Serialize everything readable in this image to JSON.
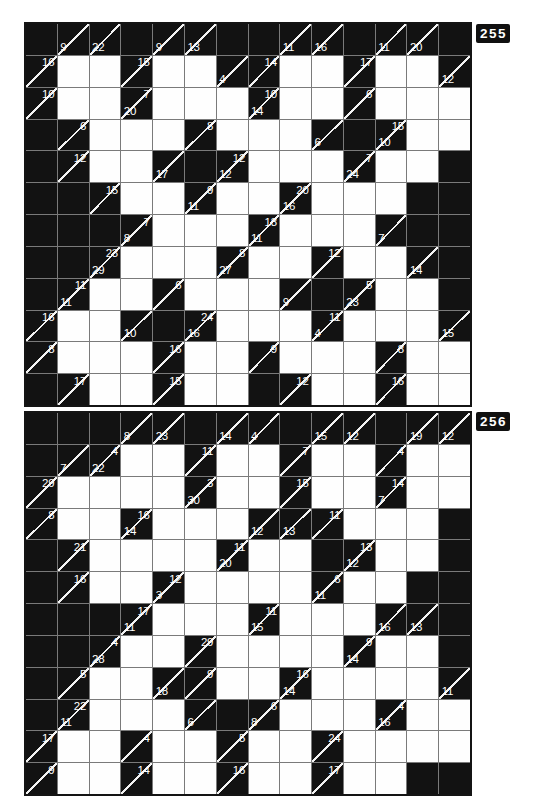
{
  "style": {
    "black_cell_color": "#121212",
    "white_cell_color": "#fefefe",
    "grid_line_color": "#7a7a7a",
    "diagonal_color": "#f2f2f2",
    "clue_text_color": "#ffffff",
    "badge_bg": "#101010",
    "badge_text_color": "#ffffff"
  },
  "cell_legend": {
    ".": "black filled cell",
    "w": "white answer cell",
    "D:A": "clue cell, D = down sum (bottom-left), A = across sum (top-right)"
  },
  "puzzles": [
    {
      "label": "255",
      "rows": 12,
      "cols": 14,
      "grid": [
        [
          ".",
          "9:",
          "22:",
          ".",
          "9:",
          "13:",
          ".",
          ".",
          "11:",
          "16:",
          ".",
          "11:",
          "20:",
          "."
        ],
        [
          ":16",
          "w",
          "w",
          ":15",
          "w",
          "w",
          "4:",
          ":14",
          "w",
          "w",
          ":17",
          "w",
          "w",
          "12:"
        ],
        [
          ":10",
          "w",
          "w",
          "20:7",
          "w",
          "w",
          "w",
          "14:10",
          "w",
          "w",
          ":6",
          "w",
          "w",
          "w"
        ],
        [
          ".",
          ":6",
          "w",
          "w",
          "w",
          ":8",
          "w",
          "w",
          "w",
          "6:",
          ".",
          "10:15",
          "w",
          "w"
        ],
        [
          ".",
          ":12",
          "w",
          "w",
          "17:",
          ".",
          "12:12",
          "w",
          "w",
          "w",
          "24:7",
          "w",
          "w",
          "."
        ],
        [
          ".",
          ".",
          ":15",
          "w",
          "w",
          "11:9",
          "w",
          "w",
          "16:20",
          "w",
          "w",
          "w",
          ".",
          "."
        ],
        [
          ".",
          ".",
          ".",
          "8:7",
          "w",
          "w",
          "w",
          "11:18",
          "w",
          "w",
          "w",
          "7:",
          ".",
          "."
        ],
        [
          ".",
          ".",
          "29:23",
          "w",
          "w",
          "w",
          "27:8",
          "w",
          "w",
          ":12",
          "w",
          "w",
          "14:",
          "."
        ],
        [
          ".",
          "11:11",
          "w",
          "w",
          ":6",
          "w",
          "w",
          "w",
          "9:",
          ".",
          "23:5",
          "w",
          "w",
          "."
        ],
        [
          ":16",
          "w",
          "w",
          "10:",
          ".",
          "16:24",
          "w",
          "w",
          "w",
          "4:11",
          "w",
          "w",
          "w",
          "15:"
        ],
        [
          ":8",
          "w",
          "w",
          "w",
          ":16",
          "w",
          "w",
          ":9",
          "w",
          "w",
          "w",
          ":8",
          "w",
          "w"
        ],
        [
          ".",
          ":17",
          "w",
          "w",
          ":15",
          "w",
          "w",
          ".",
          ":12",
          "w",
          "w",
          ":16",
          "w",
          "w"
        ]
      ]
    },
    {
      "label": "256",
      "rows": 12,
      "cols": 14,
      "grid": [
        [
          ".",
          ".",
          ".",
          "8:",
          "23:",
          ".",
          "14:",
          "4:",
          ".",
          "15:",
          "12:",
          ".",
          "19:",
          "12:"
        ],
        [
          ".",
          "7:",
          "22:4",
          "w",
          "w",
          ":11",
          "w",
          "w",
          ":7",
          "w",
          "w",
          ":4",
          "w",
          "w"
        ],
        [
          ":29",
          "w",
          "w",
          "w",
          "w",
          "30:3",
          "w",
          "w",
          ":15",
          "w",
          "w",
          "7:14",
          "w",
          "w"
        ],
        [
          ":8",
          "w",
          "w",
          "14:16",
          "w",
          "w",
          "w",
          "12:",
          "13:",
          ":11",
          "w",
          "w",
          "w",
          "."
        ],
        [
          ".",
          ":21",
          "w",
          "w",
          "w",
          "w",
          "20:11",
          "w",
          "w",
          ".",
          "12:13",
          "w",
          "w",
          "."
        ],
        [
          ".",
          ":16",
          "w",
          "w",
          "3:12",
          "w",
          "w",
          "w",
          "w",
          "11:6",
          "w",
          "w",
          ".",
          "."
        ],
        [
          ".",
          ".",
          ".",
          "11:17",
          "w",
          "w",
          "w",
          "15:11",
          "w",
          "w",
          "w",
          "16:",
          "13:",
          "."
        ],
        [
          ".",
          ".",
          "28:4",
          "w",
          "w",
          ":29",
          "w",
          "w",
          "w",
          "w",
          "14:9",
          "w",
          "w",
          "."
        ],
        [
          ".",
          ":5",
          "w",
          "w",
          "18:",
          ":9",
          "w",
          "w",
          "14:16",
          "w",
          "w",
          "w",
          "w",
          "11:"
        ],
        [
          ".",
          "11:22",
          "w",
          "w",
          "w",
          "6:",
          ".",
          "8:6",
          "w",
          "w",
          "w",
          "16:4",
          "w",
          "w"
        ],
        [
          ":17",
          "w",
          "w",
          ":4",
          "w",
          "w",
          ":5",
          "w",
          "w",
          ":24",
          "w",
          "w",
          "w",
          "w"
        ],
        [
          ":9",
          "w",
          "w",
          ":14",
          "w",
          "w",
          ":16",
          "w",
          "w",
          ":17",
          "w",
          "w",
          ".",
          "."
        ]
      ]
    }
  ]
}
